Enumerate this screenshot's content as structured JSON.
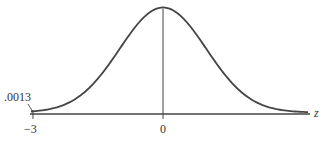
{
  "chart_data": {
    "type": "line",
    "title": "",
    "xlabel": "z",
    "ylabel": "",
    "x_ticks": [
      "−3",
      "0"
    ],
    "x_tick_values": [
      -3,
      0
    ],
    "xlim": [
      -3,
      3.25
    ],
    "annotations": [
      {
        "text": ".0013",
        "points_to": {
          "x": -3,
          "y": 0
        }
      }
    ],
    "series": [
      {
        "name": "standard normal density",
        "x": [
          -3,
          -2.5,
          -2,
          -1.5,
          -1,
          -0.5,
          0,
          0.5,
          1,
          1.5,
          2,
          2.5,
          3,
          3.25
        ],
        "values": [
          0.0044,
          0.0175,
          0.054,
          0.1295,
          0.242,
          0.3521,
          0.3989,
          0.3521,
          0.242,
          0.1295,
          0.054,
          0.0175,
          0.0044,
          0.002
        ]
      }
    ],
    "grid": false,
    "legend": "none"
  },
  "labels": {
    "tail_area": ".0013",
    "tick_neg3": "−3",
    "tick_0": "0",
    "axis_var": "z"
  }
}
